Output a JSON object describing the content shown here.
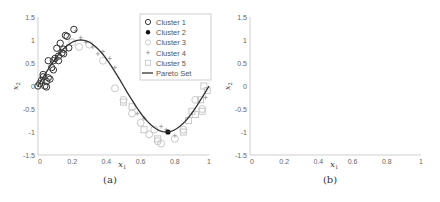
{
  "chart_data": [
    {
      "type": "scatter",
      "panel": "(a)",
      "xlabel": "x1",
      "ylabel": "x2",
      "xlim": [
        0,
        1
      ],
      "ylim": [
        -1.5,
        1.5
      ],
      "xticks": [
        "0",
        "0.2",
        "0.4",
        "0.6",
        "0.8",
        "1"
      ],
      "yticks": [
        "-1.5",
        "-1",
        "-0.5",
        "0",
        "0.5",
        "1",
        "1.5"
      ],
      "legend": [
        "Cluster 1",
        "Cluster 2",
        "Cluster 3",
        "Cluster 4",
        "Cluster 5",
        "Pareto Set"
      ],
      "legend_position": "upper right",
      "grid": false,
      "series": [
        {
          "name": "Cluster 1",
          "marker": "open-circle",
          "color": "#333333",
          "points": [
            [
              0.0,
              0.0
            ],
            [
              0.01,
              0.05
            ],
            [
              0.02,
              0.12
            ],
            [
              0.03,
              0.2
            ],
            [
              0.03,
              0.25
            ],
            [
              0.04,
              0.0
            ],
            [
              0.05,
              -0.02
            ],
            [
              0.05,
              0.1
            ],
            [
              0.06,
              0.18
            ],
            [
              0.07,
              0.15
            ],
            [
              0.06,
              0.55
            ],
            [
              0.08,
              0.4
            ],
            [
              0.09,
              0.55
            ],
            [
              0.09,
              0.35
            ],
            [
              0.1,
              0.6
            ],
            [
              0.11,
              0.82
            ],
            [
              0.12,
              0.65
            ],
            [
              0.12,
              0.55
            ],
            [
              0.13,
              0.93
            ],
            [
              0.14,
              0.72
            ],
            [
              0.15,
              0.8
            ],
            [
              0.15,
              0.7
            ],
            [
              0.16,
              1.1
            ],
            [
              0.17,
              1.08
            ],
            [
              0.18,
              0.83
            ],
            [
              0.21,
              1.23
            ]
          ]
        },
        {
          "name": "Cluster 2",
          "marker": "filled-circle",
          "color": "#111111",
          "points": [
            [
              0.76,
              -1.0
            ]
          ]
        },
        {
          "name": "Cluster 3",
          "marker": "open-diamond",
          "color": "#c8c8c8",
          "points": [
            [
              0.2,
              0.95
            ],
            [
              0.24,
              0.85
            ],
            [
              0.3,
              0.9
            ],
            [
              0.38,
              0.55
            ],
            [
              0.45,
              -0.05
            ],
            [
              0.5,
              -0.3
            ],
            [
              0.55,
              -0.6
            ],
            [
              0.6,
              -0.8
            ],
            [
              0.65,
              -1.05
            ],
            [
              0.7,
              -1.2
            ],
            [
              0.72,
              -1.25
            ],
            [
              0.68,
              -0.95
            ],
            [
              0.8,
              -1.15
            ],
            [
              0.85,
              -0.95
            ],
            [
              0.92,
              -0.3
            ],
            [
              0.96,
              -0.5
            ]
          ]
        },
        {
          "name": "Cluster 4",
          "marker": "plus",
          "color": "#a8a8a8",
          "points": [
            [
              0.22,
              1.2
            ],
            [
              0.25,
              1.05
            ],
            [
              0.28,
              0.95
            ],
            [
              0.32,
              0.85
            ],
            [
              0.35,
              0.7
            ],
            [
              0.38,
              0.75
            ],
            [
              0.42,
              0.6
            ],
            [
              0.45,
              0.4
            ],
            [
              0.58,
              -0.6
            ],
            [
              0.62,
              -0.7
            ],
            [
              0.72,
              -0.88
            ],
            [
              0.75,
              -0.95
            ],
            [
              0.8,
              -1.08
            ],
            [
              0.98,
              -0.25
            ]
          ]
        },
        {
          "name": "Cluster 5",
          "marker": "open-square",
          "color": "#c8c8c8",
          "points": [
            [
              0.5,
              -0.35
            ],
            [
              0.55,
              -0.45
            ],
            [
              0.62,
              -0.95
            ],
            [
              0.7,
              -1.15
            ],
            [
              0.85,
              -1.0
            ],
            [
              0.88,
              -0.75
            ],
            [
              0.9,
              -0.55
            ],
            [
              0.92,
              -0.62
            ],
            [
              0.95,
              -0.3
            ],
            [
              0.97,
              0.0
            ],
            [
              0.99,
              -0.1
            ],
            [
              0.96,
              -0.55
            ]
          ]
        },
        {
          "name": "Pareto Set",
          "type": "line",
          "color": "#333333",
          "function": "x2 = sin(2*pi*x1)",
          "x_range": [
            0,
            1
          ]
        }
      ]
    },
    {
      "type": "scatter",
      "panel": "(b)",
      "xlabel": "x1",
      "ylabel": "x2",
      "xlim": [
        0,
        1
      ],
      "ylim": [
        -1.5,
        1.5
      ],
      "xticks": [
        "0",
        "0.2",
        "0.4",
        "0.6",
        "0.8",
        "1"
      ],
      "yticks": [
        "-1.5",
        "-1",
        "-0.5",
        "0",
        "0.5",
        "1",
        "1.5"
      ],
      "legend": [
        "Cluster 1",
        "Cluster 2",
        "Cluster 3",
        "Cluster 4",
        "Cluster 5",
        "Pareto Set"
      ],
      "legend_position": "upper right",
      "grid": false,
      "annotations": [
        {
          "text": "ψ1",
          "x": 0.06,
          "y": 0.97
        },
        {
          "text": "ψ2",
          "x": 0.42,
          "y": -1.35,
          "arrow_to": [
            0.73,
            -1.03
          ]
        },
        {
          "text": "ψ3",
          "x": 0.5,
          "y": -0.22
        },
        {
          "text": "ψ4",
          "x": 0.6,
          "y": 0.3
        },
        {
          "text": "ψ5",
          "x": 0.93,
          "y": -0.78
        }
      ],
      "fitted_lines": [
        {
          "name": "psi1",
          "from": [
            -0.02,
            -0.2
          ],
          "to": [
            0.24,
            1.38
          ]
        },
        {
          "name": "psi3",
          "from": [
            0.1,
            1.1
          ],
          "to": [
            0.8,
            -1.2
          ]
        },
        {
          "name": "psi4",
          "from": [
            0.2,
            1.5
          ],
          "to": [
            0.86,
            -1.3
          ]
        },
        {
          "name": "psi5",
          "from": [
            0.73,
            -1.45
          ],
          "to": [
            1.04,
            0.15
          ]
        },
        {
          "name": "psi5b",
          "from": [
            0.7,
            -0.95
          ],
          "to": [
            1.02,
            0.0
          ]
        }
      ]
    }
  ],
  "panels": {
    "a": {
      "caption": "(a)",
      "xlabel": "x",
      "xlabel_sub": "1",
      "ylabel": "x",
      "ylabel_sub": "2",
      "legend": {
        "items": [
          "Cluster 1",
          "Cluster 2",
          "Cluster 3",
          "Cluster 4",
          "Cluster 5",
          "Pareto Set"
        ]
      }
    },
    "b": {
      "caption": "(b)",
      "xlabel": "x",
      "xlabel_sub": "1",
      "ylabel": "x",
      "ylabel_sub": "2",
      "legend": {
        "items": [
          "Cluster 1",
          "Cluster 2",
          "Cluster 3",
          "Cluster 4",
          "Cluster 5",
          "Pareto Set"
        ]
      },
      "annotations": {
        "psi1": "ψ",
        "psi1_sub": "1",
        "psi2": "ψ",
        "psi2_sub": "2",
        "psi3": "ψ",
        "psi3_sub": "3",
        "psi4": "ψ",
        "psi4_sub": "4",
        "psi5": "ψ",
        "psi5_sub": "5"
      }
    }
  },
  "ticks": {
    "x": [
      "0",
      "0.2",
      "0.4",
      "0.6",
      "0.8",
      "1"
    ],
    "y": [
      "1.5",
      "1",
      "0.5",
      "0",
      "-0.5",
      "-1",
      "-1.5"
    ]
  }
}
